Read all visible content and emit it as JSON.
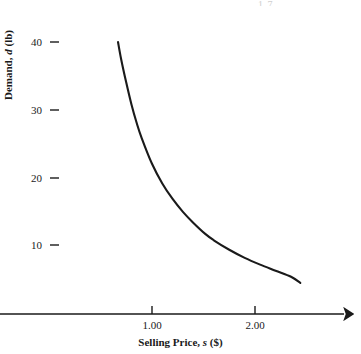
{
  "figure": {
    "background_color": "#ffffff",
    "ink_color": "#1a1a1a",
    "corner_artifact_text": "1.7"
  },
  "axes": {
    "y_title_prefix": "Demand, ",
    "y_title_italic": "d",
    "y_title_suffix": " (lb)",
    "x_title_prefix": "Selling Price, ",
    "x_title_italic": "s",
    "x_title_suffix": " ($)",
    "y_ticks": [
      {
        "label": "40",
        "value": 40
      },
      {
        "label": "30",
        "value": 30
      },
      {
        "label": "20",
        "value": 20
      },
      {
        "label": "10",
        "value": 10
      }
    ],
    "x_ticks": [
      {
        "label": "1.00",
        "value": 1.0
      },
      {
        "label": "2.00",
        "value": 2.0
      }
    ]
  },
  "chart_data": {
    "type": "line",
    "title": "",
    "xlabel": "Selling Price, s ($)",
    "ylabel": "Demand, d (lb)",
    "xlim": [
      0,
      2.9
    ],
    "ylim": [
      0,
      44.5
    ],
    "grid": false,
    "legend": null,
    "annotations": [],
    "series": [
      {
        "name": "Demand curve",
        "description": "Decreasing convex demand curve, approximately d = 26.8 / s, flattening toward an asymptote near d = 4",
        "x": [
          0.67,
          0.7,
          0.75,
          0.8,
          0.85,
          0.9,
          1.0,
          1.1,
          1.2,
          1.3,
          1.4,
          1.52,
          1.6,
          1.75,
          1.9,
          2.05,
          2.2,
          2.35,
          2.44
        ],
        "y": [
          40.0,
          37.5,
          34.0,
          30.8,
          28.1,
          25.8,
          22.0,
          19.1,
          16.8,
          14.9,
          13.3,
          11.6,
          10.7,
          9.3,
          8.1,
          7.1,
          6.2,
          5.3,
          4.4
        ]
      }
    ]
  }
}
